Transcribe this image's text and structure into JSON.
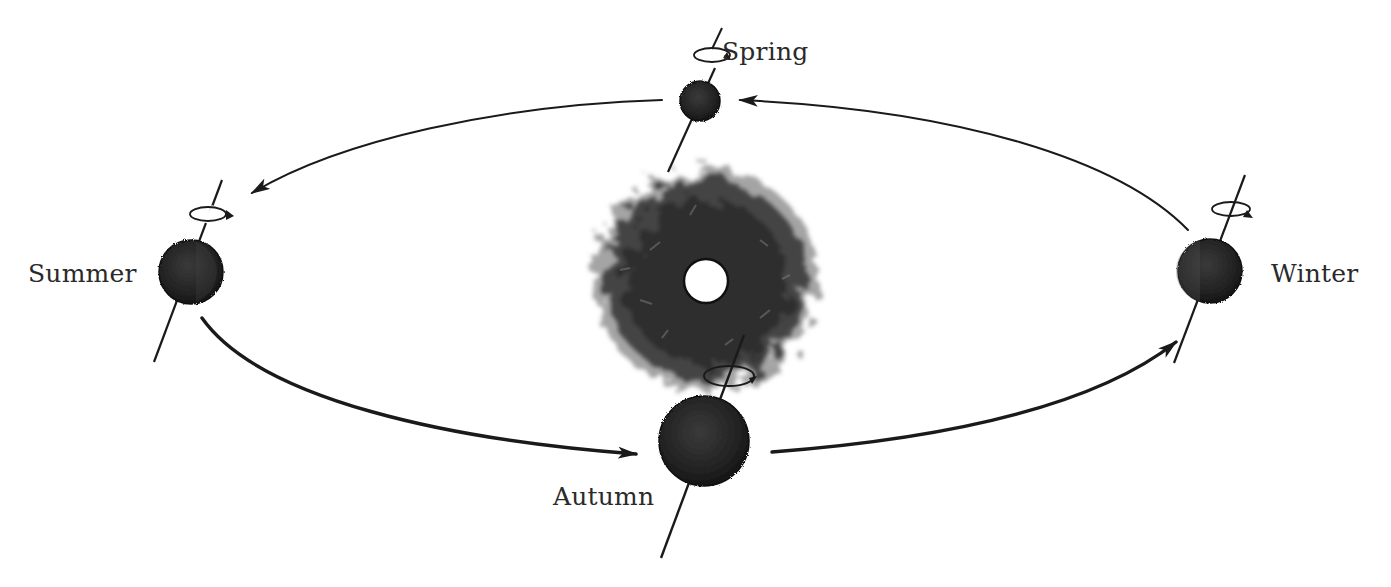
{
  "diagram": {
    "colors": {
      "background": "#ffffff",
      "ink": "#1a1a1a",
      "planet": "#262626",
      "sun_halo": "#3a3a3a",
      "sun_core": "#ffffff",
      "label": "#2a2a2a"
    },
    "sun": {
      "x": 706,
      "y": 280,
      "core_radius": 22,
      "halo_radius": 118
    },
    "positions": [
      {
        "id": "spring",
        "label": "Spring",
        "x": 700,
        "y": 101,
        "radius": 21,
        "label_x": 722,
        "label_y": 37
      },
      {
        "id": "summer",
        "label": "Summer",
        "x": 191,
        "y": 272,
        "radius": 32,
        "label_x": 28,
        "label_y": 261
      },
      {
        "id": "autumn",
        "label": "Autumn",
        "x": 704,
        "y": 441,
        "radius": 45,
        "label_x": 553,
        "label_y": 483
      },
      {
        "id": "winter",
        "label": "Winter",
        "x": 1212,
        "y": 271,
        "radius": 32,
        "label_x": 1271,
        "label_y": 261
      }
    ],
    "arrows": [
      {
        "from": "winter",
        "to": "spring",
        "direction": "counter-clockwise"
      },
      {
        "from": "spring",
        "to": "summer",
        "direction": "counter-clockwise"
      },
      {
        "from": "summer",
        "to": "autumn",
        "direction": "counter-clockwise"
      },
      {
        "from": "autumn",
        "to": "winter",
        "direction": "counter-clockwise"
      }
    ]
  }
}
